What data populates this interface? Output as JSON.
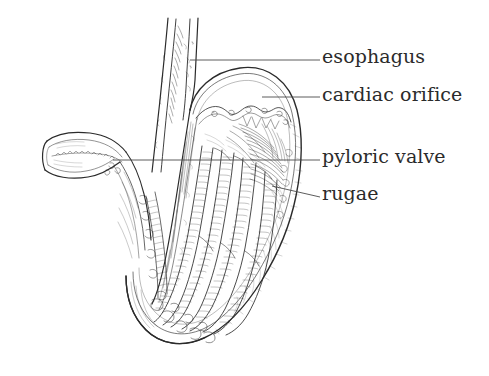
{
  "figure": {
    "style": "pen-and-ink line drawing",
    "background_color": "#ffffff",
    "ink_color": "#2b2b2b",
    "labels": [
      {
        "id": "esophagus",
        "text": "esophagus",
        "leader_start_x": 190,
        "leader_start_y": 60,
        "leader_end_x": 320,
        "leader_end_y": 60
      },
      {
        "id": "cardiac-orifice",
        "text": "cardiac orifice",
        "leader_start_x": 262,
        "leader_start_y": 97,
        "leader_end_x": 320,
        "leader_end_y": 97
      },
      {
        "id": "pyloric-valve",
        "text": "pyloric valve",
        "leader_start_x": 113,
        "leader_start_y": 160,
        "leader_end_x": 320,
        "leader_end_y": 160
      },
      {
        "id": "rugae",
        "text": "rugae",
        "leader_start_x": 272,
        "leader_start_y": 186,
        "leader_end_x": 320,
        "leader_end_y": 197
      }
    ]
  }
}
